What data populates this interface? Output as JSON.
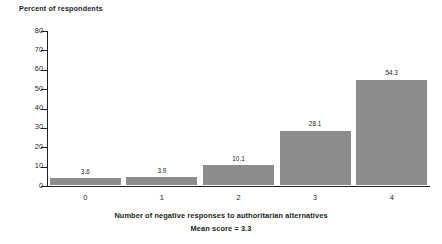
{
  "chart_data": {
    "type": "bar",
    "title": "",
    "categories": [
      "0",
      "1",
      "2",
      "3",
      "4"
    ],
    "values": [
      3.6,
      3.9,
      10.1,
      28.1,
      54.3
    ],
    "value_labels": [
      "3.6",
      "3.9",
      "10.1",
      "28.1",
      "54.3"
    ],
    "xlabel": "Number of negative responses to authoritarian alternatives",
    "xlabel_sub": "Mean score = 3.3",
    "ylabel": "Percent of respondents",
    "ylim": [
      0,
      80
    ],
    "yticks": [
      0,
      10,
      20,
      30,
      40,
      50,
      60,
      70,
      80
    ],
    "ytick_labels": [
      "0",
      "10",
      "20",
      "30",
      "40",
      "50",
      "60",
      "70",
      "80"
    ],
    "grid": false,
    "legend": null,
    "bar_color": "#8c8c8c",
    "axis_color": "#231f20",
    "background": "#ffffff"
  }
}
